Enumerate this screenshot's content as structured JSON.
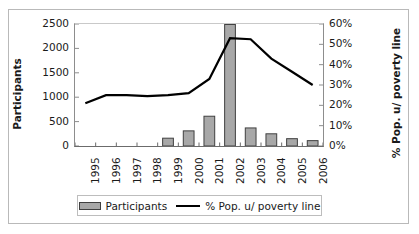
{
  "chart_data": {
    "type": "bar",
    "title": "",
    "xlabel": "",
    "ylabel": "Participants",
    "y2label": "% Pop. u/ poverty line",
    "categories": [
      "1995",
      "1996",
      "1997",
      "1998",
      "1999",
      "2000",
      "2001",
      "2002",
      "2003",
      "2004",
      "2005",
      "2006"
    ],
    "series": [
      {
        "name": "Participants",
        "type": "bar",
        "axis": "left",
        "color": "#a8a8a8",
        "edge_color": "#404040",
        "values": [
          0,
          0,
          0,
          0,
          160,
          310,
          610,
          2490,
          370,
          250,
          150,
          110
        ]
      },
      {
        "name": "% Pop. u/ poverty line",
        "type": "line",
        "axis": "right",
        "color": "#000000",
        "values": [
          21,
          25,
          25,
          24.5,
          25,
          26,
          33,
          53,
          52.5,
          43,
          36.5,
          30
        ]
      }
    ],
    "ylim": [
      0,
      2500
    ],
    "y2lim": [
      0,
      60
    ],
    "yticks": [
      0,
      500,
      1000,
      1500,
      2000,
      2500
    ],
    "yticklabels": [
      "0",
      "500",
      "1000",
      "1500",
      "2000",
      "2500"
    ],
    "y2ticks": [
      0,
      10,
      20,
      30,
      40,
      50,
      60
    ],
    "y2ticklabels": [
      "0%",
      "10%",
      "20%",
      "30%",
      "40%",
      "50%",
      "60%"
    ],
    "grid": false,
    "legend_position": "bottom",
    "legend": [
      {
        "label": "Participants",
        "marker": "bar-swatch"
      },
      {
        "label": "% Pop. u/ poverty line",
        "marker": "line-swatch"
      }
    ]
  }
}
